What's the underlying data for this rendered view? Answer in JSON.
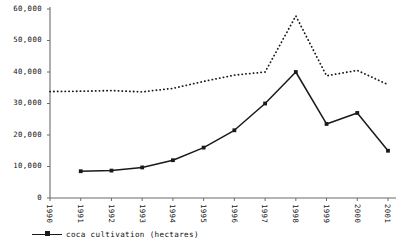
{
  "chart_data": {
    "type": "line",
    "title": "",
    "xlabel": "",
    "ylabel": "",
    "categories": [
      "1990",
      "1991",
      "1992",
      "1993",
      "1994",
      "1995",
      "1996",
      "1997",
      "1998",
      "1999",
      "2000",
      "2001"
    ],
    "x": [
      1990,
      1991,
      1992,
      1993,
      1994,
      1995,
      1996,
      1997,
      1998,
      1999,
      2000,
      2001
    ],
    "ylim": [
      0,
      60000
    ],
    "xlim": [
      1990,
      2001
    ],
    "yticks": [
      0,
      10000,
      20000,
      30000,
      40000,
      50000,
      60000
    ],
    "ytick_labels": [
      "0",
      "10,000",
      "20,000",
      "30,000",
      "40,000",
      "50,000",
      "60,000"
    ],
    "grid": false,
    "legend_position": "bottom-left",
    "series": [
      {
        "name": "coca cultivation (hectares)",
        "style": "solid",
        "marker": "square",
        "color": "#1a1a1a",
        "in_legend": true,
        "values": [
          null,
          8500,
          8700,
          9700,
          12000,
          16000,
          21500,
          30000,
          40000,
          23500,
          27000,
          15000
        ]
      },
      {
        "name": "",
        "style": "dotted",
        "marker": "none",
        "color": "#1a1a1a",
        "in_legend": false,
        "values": [
          33800,
          33900,
          34100,
          33700,
          34800,
          37000,
          39000,
          40000,
          57800,
          38800,
          40500,
          36000
        ]
      }
    ]
  },
  "legend": {
    "items": [
      {
        "label": "coca cultivation (hectares)"
      }
    ]
  },
  "axes": {
    "y_title": "",
    "x_title": ""
  }
}
